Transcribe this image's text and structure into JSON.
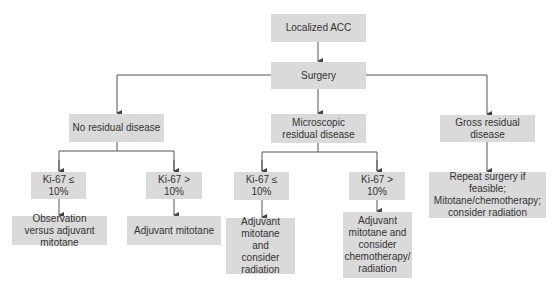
{
  "diagram": {
    "nodes": {
      "root": "Localized ACC",
      "surgery": "Surgery",
      "no_residual": "No residual disease",
      "microscopic": "Microscopic residual disease",
      "gross": "Gross residual disease",
      "nr_ki_low": "Ki-67 ≤ 10%",
      "nr_ki_high": "Ki-67 > 10%",
      "nr_low_tx": "Observation versus adjuvant mitotane",
      "nr_high_tx": "Adjuvant mitotane",
      "mic_ki_low": "Ki-67 ≤ 10%",
      "mic_ki_high": "Ki-67 > 10%",
      "mic_low_tx": "Adjuvant mitotane and consider radiation",
      "mic_high_tx": "Adjuvant mitotane and consider chemotherapy/ radiation",
      "gross_tx": "Repeat surgery if feasible; Mitotane/chemotherapy; consider radiation"
    },
    "colors": {
      "box_fill": "#dadada",
      "text": "#333333",
      "line": "#555555"
    }
  }
}
